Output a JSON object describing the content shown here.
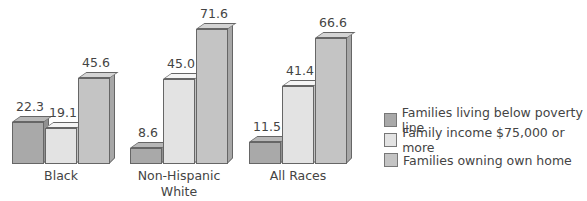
{
  "chart_data": {
    "type": "bar",
    "title": "",
    "xlabel": "",
    "ylabel": "",
    "categories": [
      "Black",
      "Non-Hispanic White",
      "All Races"
    ],
    "category_labels": [
      [
        "Black"
      ],
      [
        "Non-Hispanic",
        "White"
      ],
      [
        "All Races"
      ]
    ],
    "series": [
      {
        "name": "Families living below poverty line",
        "values": [
          22.3,
          8.6,
          11.5
        ],
        "color": "#a9a9a9"
      },
      {
        "name": "Family income $75,000 or more",
        "values": [
          19.1,
          45.0,
          41.4
        ],
        "color": "#e3e3e3"
      },
      {
        "name": "Families owning own home",
        "values": [
          45.6,
          71.6,
          66.6
        ],
        "color": "#c4c4c4"
      }
    ],
    "value_labels": [
      [
        "22.3",
        "19.1",
        "45.6"
      ],
      [
        "8.6",
        "45.0",
        "71.6"
      ],
      [
        "11.5",
        "41.4",
        "66.6"
      ]
    ],
    "ylim": [
      0,
      75
    ],
    "grid": false,
    "legend_position": "right",
    "style": "3d-bar"
  }
}
